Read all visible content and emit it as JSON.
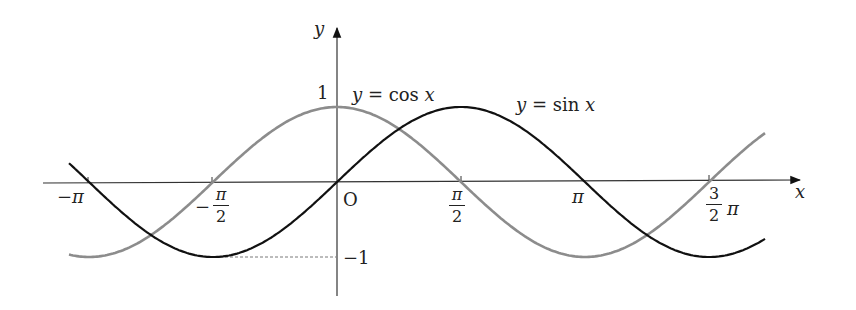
{
  "chart_data": {
    "type": "line",
    "title": "",
    "xlabel": "x",
    "ylabel": "y",
    "origin_label": "O",
    "xlim": [
      -3.29,
      5.09
    ],
    "ylim": [
      -1.5,
      2.05
    ],
    "grid": false,
    "x_ticks": [
      {
        "value": -3.14159,
        "label": "−π"
      },
      {
        "value": -1.5708,
        "label": "−π/2"
      },
      {
        "value": 1.5708,
        "label": "π/2"
      },
      {
        "value": 3.14159,
        "label": "π"
      },
      {
        "value": 4.71239,
        "label": "3/2 π"
      }
    ],
    "y_ticks": [
      {
        "value": 1,
        "label": "1"
      },
      {
        "value": -1,
        "label": "−1"
      }
    ],
    "series": [
      {
        "name": "y = sin x",
        "color": "#111111",
        "function": "sin",
        "x_range": [
          -3.4,
          5.5
        ]
      },
      {
        "name": "y = cos x",
        "color": "#8c8c8c",
        "function": "cos",
        "x_range": [
          -3.4,
          5.5
        ]
      }
    ],
    "annotations": [
      {
        "text": "y = cos x",
        "near_x": 0.2,
        "near_y": 1.15
      },
      {
        "text": "y = sin x",
        "near_x": 2.3,
        "near_y": 1.05
      },
      {
        "text": "dashed guide from (−π/2, −1) to y-axis",
        "type": "dashed-line"
      }
    ]
  },
  "labels": {
    "y_axis": "y",
    "x_axis": "x",
    "origin": "O",
    "one": "1",
    "minus_one": "−1",
    "cos_label_y": "y",
    "cos_label_eq": " = cos ",
    "cos_label_x": "x",
    "sin_label_y": "y",
    "sin_label_eq": " = sin ",
    "sin_label_x": "x",
    "neg_pi": "−π",
    "neg_half_pi_num": "π",
    "neg_half_pi_den": "2",
    "neg_sign": "−",
    "half_pi_num": "π",
    "half_pi_den": "2",
    "pi": "π",
    "three_half_num": "3",
    "three_half_den": "2",
    "three_half_pi": "π"
  }
}
